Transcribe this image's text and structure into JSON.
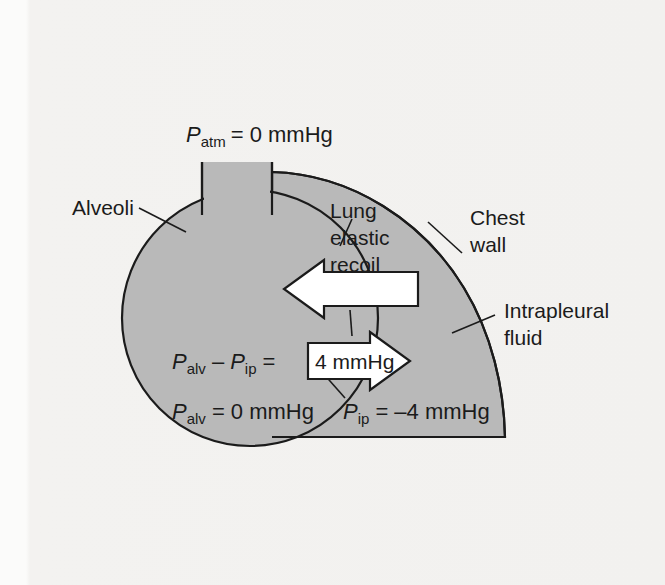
{
  "figure": {
    "background_color": "#f3f2f0",
    "fill_color": "#b9b9b9",
    "outline_color": "#1b1b1b",
    "arrow_fill": "#ffffff"
  },
  "labels": {
    "atm_pressure": {
      "symbol": "P",
      "subscript": "atm",
      "value": "= 0 mmHg",
      "full": "P atm = 0 mmHg"
    },
    "alveoli": "Alveoli",
    "chest_wall_line1": "Chest",
    "chest_wall_line2": "wall",
    "intrapleural_line1": "Intrapleural",
    "intrapleural_line2": "fluid",
    "recoil_line1": "Lung",
    "recoil_line2": "elastic",
    "recoil_line3": "recoil",
    "equation": {
      "symbol1": "P",
      "subscript1": "alv",
      "minus": "–",
      "symbol2": "P",
      "subscript2": "ip",
      "equals": "=",
      "boxed_value": "4 mmHg"
    },
    "alveolar_pressure": {
      "symbol": "P",
      "subscript": "alv",
      "value": "= 0 mmHg",
      "full": "P alv = 0 mmHg"
    },
    "intrapleural_pressure": {
      "symbol": "P",
      "subscript": "ip",
      "value": "= –4 mmHg",
      "full": "P ip = -4 mmHg"
    }
  },
  "icons": {
    "recoil_arrow": "left-arrow-icon",
    "pressure_arrow": "right-arrow-icon"
  }
}
